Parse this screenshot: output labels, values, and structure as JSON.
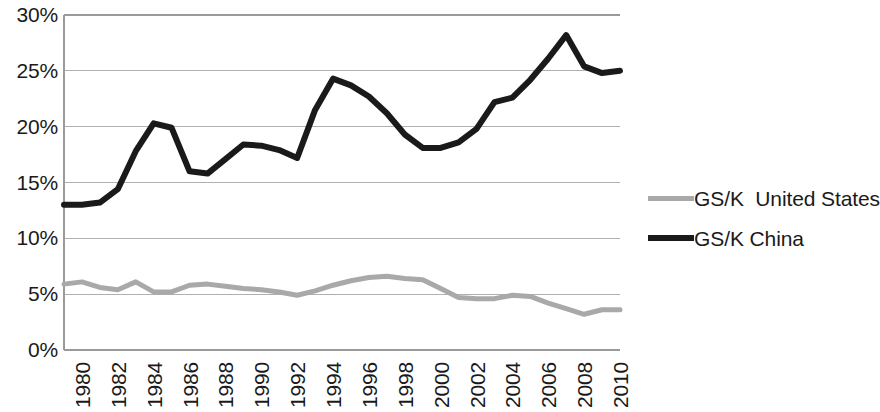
{
  "chart_data": {
    "type": "line",
    "title": "",
    "subtitle": "",
    "xlabel": "",
    "ylabel": "",
    "xlim": [
      1980,
      2011
    ],
    "ylim": [
      0,
      30
    ],
    "ytick_labels": [
      "30%",
      "25%",
      "20%",
      "15%",
      "10%",
      "5%",
      "0%"
    ],
    "ytick_values": [
      30,
      25,
      20,
      15,
      10,
      5,
      0
    ],
    "xtick_labels": [
      "1980",
      "1982",
      "1984",
      "1986",
      "1988",
      "1990",
      "1992",
      "1994",
      "1996",
      "1998",
      "2000",
      "2002",
      "2004",
      "2006",
      "2008",
      "2010"
    ],
    "xtick_values": [
      1980,
      1982,
      1984,
      1986,
      1988,
      1990,
      1992,
      1994,
      1996,
      1998,
      2000,
      2002,
      2004,
      2006,
      2008,
      2010
    ],
    "grid": "horizontal",
    "legend_position": "right",
    "x": [
      1980,
      1981,
      1982,
      1983,
      1984,
      1985,
      1986,
      1987,
      1988,
      1989,
      1990,
      1991,
      1992,
      1993,
      1994,
      1995,
      1996,
      1997,
      1998,
      1999,
      2000,
      2001,
      2002,
      2003,
      2004,
      2005,
      2006,
      2007,
      2008,
      2009,
      2010,
      2011
    ],
    "series": [
      {
        "name": "GS/K  United States",
        "color": "#a9a9a9",
        "width": 5,
        "values": [
          5.9,
          6.1,
          5.6,
          5.4,
          6.1,
          5.2,
          5.2,
          5.8,
          5.9,
          5.7,
          5.5,
          5.4,
          5.2,
          4.9,
          5.3,
          5.8,
          6.2,
          6.5,
          6.6,
          6.4,
          6.3,
          5.5,
          4.7,
          4.6,
          4.6,
          4.9,
          4.8,
          4.2,
          3.7,
          3.2,
          3.6,
          3.6
        ]
      },
      {
        "name": "GS/K China",
        "color": "#1a1a1a",
        "width": 6,
        "values": [
          13.0,
          13.0,
          13.2,
          14.4,
          17.8,
          20.3,
          19.9,
          16.0,
          15.8,
          17.1,
          18.4,
          18.3,
          17.9,
          17.2,
          21.5,
          24.3,
          23.7,
          22.7,
          21.2,
          19.3,
          18.1,
          18.1,
          18.6,
          19.8,
          22.2,
          22.6,
          24.2,
          26.1,
          28.2,
          25.4,
          24.8,
          25.0
        ]
      }
    ],
    "legend": [
      {
        "label": "GS/K  United States",
        "color": "#a9a9a9",
        "style": "thin"
      },
      {
        "label": "GS/K China",
        "color": "#1a1a1a",
        "style": "thick"
      }
    ]
  },
  "colors": {
    "united_states_line": "#a9a9a9",
    "china_line": "#1a1a1a",
    "gridline": "#b0b0b0",
    "axis": "#9a9a9a",
    "background": "#ffffff",
    "text": "#1a1a1a"
  }
}
